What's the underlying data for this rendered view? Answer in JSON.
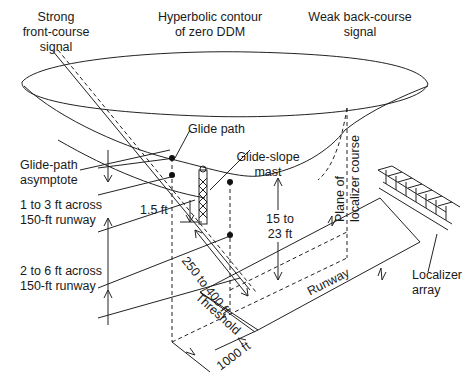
{
  "diagram": {
    "colors": {
      "line": "#222222",
      "background": "#ffffff",
      "text": "#1a1a1a"
    },
    "labels": {
      "strong_front_course": [
        "Strong",
        "front-course",
        "signal"
      ],
      "hyperbolic_contour": [
        "Hyperbolic contour",
        "of zero DDM"
      ],
      "weak_back_course": [
        "Weak back-course",
        "signal"
      ],
      "glide_path": "Glide path",
      "glide_path_asymptote": [
        "Glide-path",
        "asymptote"
      ],
      "glide_slope_mast": [
        "Glide-slope",
        "mast"
      ],
      "plane_of_localizer_course": [
        "Plane of",
        "localizer course"
      ],
      "one_to_three_ft": [
        "1 to 3 ft across",
        "150-ft runway"
      ],
      "one_point_five_ft": "1.5 ft",
      "two_to_six_ft": [
        "2 to 6 ft across",
        "150-ft runway"
      ],
      "fifteen_to_23_ft": [
        "15 to",
        "23 ft"
      ],
      "two_fifty_to_400_ft": "250 to 400 ft",
      "threshold": "Threshold",
      "runway": "Runway",
      "thousand_ft": "1000 ft",
      "localizer_array": [
        "Localizer",
        "array"
      ]
    }
  }
}
